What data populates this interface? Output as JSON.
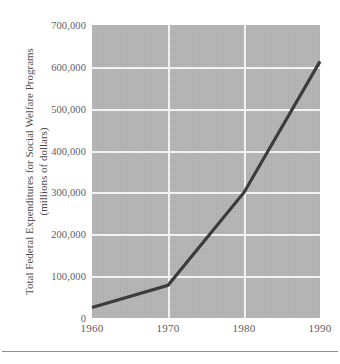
{
  "chart_data": {
    "type": "line",
    "title": "",
    "xlabel": "",
    "ylabel": "Total Federal Expenditures for Social Welfare Programs",
    "ylabel_line2": "(millions of dollars)",
    "x": [
      1960,
      1970,
      1980,
      1990
    ],
    "categories": [
      "1960",
      "1970",
      "1980",
      "1990"
    ],
    "values": [
      25000,
      78000,
      300000,
      613000
    ],
    "series": [
      {
        "name": "Total Federal Expenditures for Social Welfare Programs",
        "values": [
          25000,
          78000,
          300000,
          613000
        ]
      }
    ],
    "xlim": [
      1960,
      1990
    ],
    "ylim": [
      0,
      700000
    ],
    "xticks": [
      "1960",
      "1970",
      "1980",
      "1990"
    ],
    "yticks": [
      "0",
      "100,000",
      "200,000",
      "300,000",
      "400,000",
      "500,000",
      "600,000",
      "700,000"
    ],
    "ytick_values": [
      0,
      100000,
      200000,
      300000,
      400000,
      500000,
      600000,
      700000
    ],
    "grid": true,
    "legend": false,
    "legend_position": "none",
    "colors": {
      "line": "#3c3c3c",
      "plot_background": "#b5b5b5",
      "gridline": "#f2f2f2",
      "text": "#5a5a5a",
      "page_background": "#ffffff",
      "footer_rule": "#8e8e8e"
    }
  }
}
